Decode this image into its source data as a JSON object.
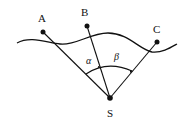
{
  "diagram": {
    "points": {
      "A": {
        "label": "A",
        "x": 43,
        "y": 32
      },
      "B": {
        "label": "B",
        "x": 87,
        "y": 26
      },
      "C": {
        "label": "C",
        "x": 157,
        "y": 42
      },
      "S": {
        "label": "S",
        "x": 110,
        "y": 98
      }
    },
    "angles": {
      "alpha": "α",
      "beta": "β"
    },
    "colors": {
      "stroke": "#111111",
      "background": "#ffffff"
    }
  }
}
